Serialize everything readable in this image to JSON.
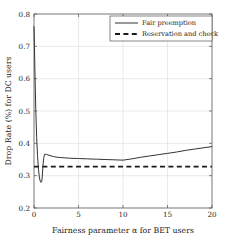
{
  "chart_data": {
    "type": "line",
    "title": "",
    "xlabel": "Fairness parameter α  for BET users",
    "ylabel": "Drop Rate (%) for DC users",
    "xlim": [
      0,
      20
    ],
    "ylim": [
      0.2,
      0.8
    ],
    "xticks": [
      "0",
      "5",
      "10",
      "15",
      "20"
    ],
    "xtick_values": [
      0,
      5,
      10,
      15,
      20
    ],
    "yticks": [
      "0.2",
      "0.3",
      "0.4",
      "0.5",
      "0.6",
      "0.7",
      "0.8"
    ],
    "ytick_values": [
      0.2,
      0.3,
      0.4,
      0.5,
      0.6,
      0.7,
      0.8
    ],
    "grid": true,
    "legend_position": "upper right",
    "series": [
      {
        "name": "Fair preemption",
        "style": "solid",
        "color": "#333333",
        "x": [
          0.0,
          0.05,
          0.1,
          0.15,
          0.2,
          0.3,
          0.4,
          0.5,
          0.6,
          0.7,
          0.78,
          0.85,
          0.9,
          0.95,
          1.0,
          1.1,
          1.2,
          1.4,
          1.8,
          2.2,
          2.6,
          3.0,
          4.0,
          5.0,
          6.0,
          7.0,
          8.0,
          9.0,
          10.0,
          11.0,
          12.0,
          13.0,
          14.0,
          15.0,
          16.0,
          17.0,
          18.0,
          19.0,
          20.0
        ],
        "y": [
          0.762,
          0.7,
          0.63,
          0.565,
          0.505,
          0.418,
          0.36,
          0.32,
          0.296,
          0.283,
          0.279,
          0.281,
          0.288,
          0.305,
          0.33,
          0.356,
          0.366,
          0.366,
          0.362,
          0.359,
          0.357,
          0.356,
          0.354,
          0.353,
          0.352,
          0.351,
          0.35,
          0.349,
          0.348,
          0.352,
          0.357,
          0.361,
          0.365,
          0.369,
          0.373,
          0.378,
          0.382,
          0.386,
          0.39
        ]
      },
      {
        "name": "Reservation and check",
        "style": "dashed",
        "color": "#1a1a1a",
        "x": [
          0,
          20
        ],
        "y": [
          0.328,
          0.328
        ]
      }
    ]
  },
  "legend": {
    "entries": [
      {
        "label": "Fair preemption",
        "style": "solid"
      },
      {
        "label": "Reservation and check",
        "style": "dashed"
      }
    ]
  },
  "axes": {
    "xlabel": "Fairness parameter α  for BET users",
    "ylabel": "Drop Rate (%) for DC users"
  },
  "colors": {
    "line": "#333333",
    "dashed_line": "#1a1a1a",
    "grid": "#d4d4d4",
    "axis": "#555555",
    "background": "#ffffff"
  }
}
